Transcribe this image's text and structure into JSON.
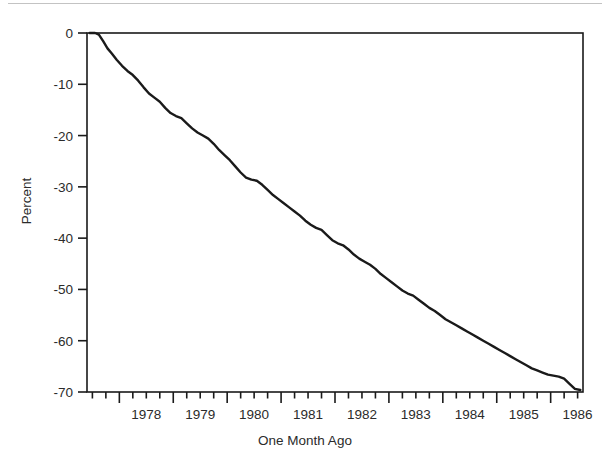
{
  "chart_data": {
    "type": "line",
    "title": "",
    "subtitle": "",
    "xlabel": "One Month Ago",
    "ylabel": "Percent",
    "grid": false,
    "legend": null,
    "xlim": [
      1977.4,
      1986.6
    ],
    "ylim": [
      -70,
      0
    ],
    "x_tick_labels": [
      "1978",
      "1979",
      "1980",
      "1981",
      "1982",
      "1983",
      "1984",
      "1985",
      "1986"
    ],
    "x_major_ticks": [
      1978,
      1979,
      1980,
      1981,
      1982,
      1983,
      1984,
      1985,
      1986
    ],
    "x_minor_tick_interval": 0.25,
    "y_tick_labels": [
      "0",
      "-10",
      "-20",
      "-30",
      "-40",
      "-50",
      "-60",
      "-70"
    ],
    "y_major_ticks": [
      0,
      -10,
      -20,
      -30,
      -40,
      -50,
      -60,
      -70
    ],
    "series": [
      {
        "name": "Percent change",
        "color": "#1a1a1a",
        "x": [
          1977.45,
          1977.55,
          1977.62,
          1977.7,
          1977.78,
          1977.86,
          1977.95,
          1978.05,
          1978.15,
          1978.25,
          1978.35,
          1978.45,
          1978.55,
          1978.65,
          1978.75,
          1978.85,
          1978.95,
          1979.05,
          1979.15,
          1979.25,
          1979.35,
          1979.45,
          1979.55,
          1979.65,
          1979.75,
          1979.85,
          1979.95,
          1980.05,
          1980.15,
          1980.25,
          1980.35,
          1980.45,
          1980.55,
          1980.65,
          1980.75,
          1980.85,
          1980.95,
          1981.05,
          1981.15,
          1981.25,
          1981.35,
          1981.45,
          1981.55,
          1981.65,
          1981.75,
          1981.85,
          1981.95,
          1982.05,
          1982.15,
          1982.25,
          1982.35,
          1982.45,
          1982.55,
          1982.65,
          1982.75,
          1982.85,
          1982.95,
          1983.05,
          1983.15,
          1983.25,
          1983.35,
          1983.45,
          1983.55,
          1983.65,
          1983.75,
          1983.85,
          1983.95,
          1984.05,
          1984.15,
          1984.25,
          1984.35,
          1984.45,
          1984.55,
          1984.65,
          1984.75,
          1984.85,
          1984.95,
          1985.05,
          1985.15,
          1985.25,
          1985.35,
          1985.45,
          1985.55,
          1985.65,
          1985.75,
          1985.85,
          1985.95,
          1986.05,
          1986.15,
          1986.25,
          1986.35,
          1986.45,
          1986.55
        ],
        "y": [
          0.0,
          0.0,
          -0.3,
          -1.6,
          -3.0,
          -4.0,
          -5.2,
          -6.4,
          -7.4,
          -8.2,
          -9.3,
          -10.6,
          -11.8,
          -12.6,
          -13.4,
          -14.6,
          -15.6,
          -16.2,
          -16.6,
          -17.6,
          -18.6,
          -19.4,
          -20.0,
          -20.6,
          -21.6,
          -22.8,
          -23.8,
          -24.8,
          -26.0,
          -27.2,
          -28.2,
          -28.6,
          -28.8,
          -29.6,
          -30.6,
          -31.6,
          -32.4,
          -33.2,
          -34.0,
          -34.8,
          -35.6,
          -36.6,
          -37.4,
          -38.0,
          -38.4,
          -39.4,
          -40.4,
          -41.0,
          -41.4,
          -42.2,
          -43.2,
          -44.0,
          -44.6,
          -45.2,
          -46.0,
          -47.0,
          -47.8,
          -48.6,
          -49.4,
          -50.2,
          -50.8,
          -51.2,
          -52.0,
          -52.8,
          -53.6,
          -54.2,
          -55.0,
          -55.8,
          -56.4,
          -57.0,
          -57.6,
          -58.2,
          -58.8,
          -59.4,
          -60.0,
          -60.6,
          -61.2,
          -61.8,
          -62.4,
          -63.0,
          -63.6,
          -64.2,
          -64.8,
          -65.4,
          -65.8,
          -66.2,
          -66.6,
          -66.8,
          -67.0,
          -67.4,
          -68.4,
          -69.4,
          -69.6
        ]
      }
    ]
  },
  "axes": {
    "y_title": "Percent",
    "x_title": "One Month Ago"
  }
}
